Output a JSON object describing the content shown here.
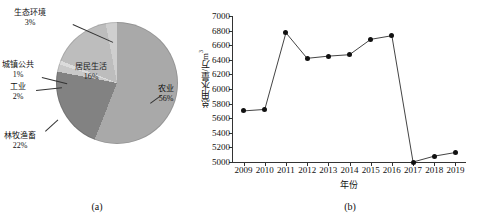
{
  "figure": {
    "panels": [
      {
        "caption": "(a)"
      },
      {
        "caption": "(b)"
      }
    ]
  },
  "chart_data": [
    {
      "type": "pie",
      "title": "",
      "panel": "(a)",
      "unit": "%",
      "categories": [
        "农业",
        "林牧渔畜",
        "工业",
        "城镇公共",
        "居民生活",
        "生态环境"
      ],
      "values": [
        56,
        22,
        2,
        1,
        16,
        3
      ],
      "labels": [
        {
          "name": "农业",
          "pct": "56%",
          "color": "#a9a9a9",
          "placement": "outside-right"
        },
        {
          "name": "林牧渔畜",
          "pct": "22%",
          "color": "#828282",
          "placement": "outside-left"
        },
        {
          "name": "工业",
          "pct": "2%",
          "color": "#c9c9c9",
          "placement": "outside-left"
        },
        {
          "name": "城镇公共",
          "pct": "1%",
          "color": "#dcdcdc",
          "placement": "outside-left"
        },
        {
          "name": "居民生活",
          "pct": "16%",
          "color": "#bdbdbd",
          "placement": "inside"
        },
        {
          "name": "生态环境",
          "pct": "3%",
          "color": "#cfcfcf",
          "placement": "outside-top"
        }
      ],
      "legend": "none"
    },
    {
      "type": "line",
      "panel": "(b)",
      "title": "",
      "xlabel": "年份",
      "ylabel": "总用水量/万m³",
      "ylabel_base": "总用水量/万m",
      "ylabel_sup": "3",
      "x": [
        "2009",
        "2010",
        "2011",
        "2012",
        "2013",
        "2014",
        "2015",
        "2016",
        "2017",
        "2018",
        "2019"
      ],
      "values": [
        5700,
        5720,
        6770,
        6420,
        6450,
        6470,
        6680,
        6730,
        5000,
        5080,
        5130
      ],
      "ylim": [
        5000,
        7000
      ],
      "yticks": [
        5000,
        5200,
        5400,
        5600,
        5800,
        6000,
        6200,
        6400,
        6600,
        6800,
        7000
      ],
      "grid": false,
      "legend": "none",
      "marker": "filled-circle",
      "marker_color": "#111111",
      "line_color": "#444444"
    }
  ]
}
